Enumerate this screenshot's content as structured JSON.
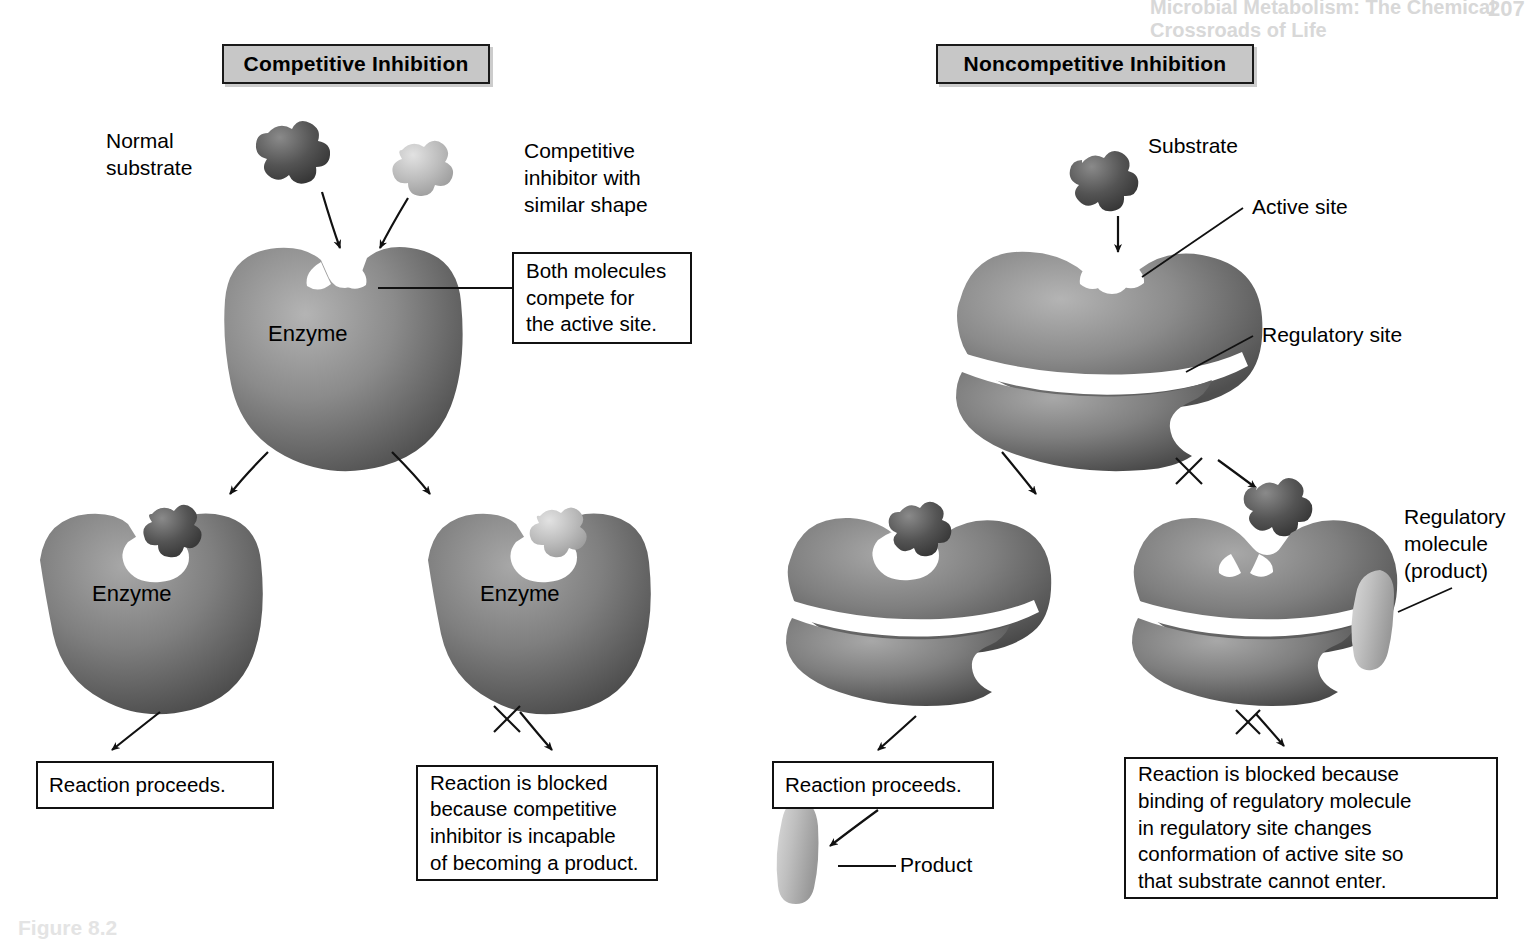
{
  "page": {
    "running_head": "Microbial Metabolism: The Chemical Crossroads of Life",
    "page_number": "207",
    "figure_caption": "Figure 8.2"
  },
  "panels": [
    {
      "id": "competitive",
      "title": "Competitive Inhibition",
      "labels": {
        "normal_substrate": "Normal\nsubstrate",
        "inhibitor": "Competitive\ninhibitor with\nsimilar shape",
        "enzyme_top": "Enzyme",
        "enzyme_left": "Enzyme",
        "enzyme_right": "Enzyme"
      },
      "callouts": {
        "compete": "Both molecules\ncompete for\nthe active site.",
        "proceeds": "Reaction proceeds.",
        "blocked": "Reaction is blocked\nbecause competitive\ninhibitor is incapable\nof becoming a product."
      }
    },
    {
      "id": "noncompetitive",
      "title": "Noncompetitive Inhibition",
      "labels": {
        "substrate": "Substrate",
        "active_site": "Active site",
        "regulatory_site": "Regulatory site",
        "regulatory_molecule": "Regulatory\nmolecule\n(product)",
        "product": "Product"
      },
      "callouts": {
        "proceeds": "Reaction proceeds.",
        "blocked": "Reaction is blocked because\nbinding of regulatory molecule\nin regulatory site changes\nconformation of active site so\nthat substrate cannot enter."
      }
    }
  ],
  "colors": {
    "plaque_fill": "#c7c7c7",
    "outline": "#111111",
    "enzyme_dark": "#5a5a5a",
    "enzyme_mid": "#8e8e8e",
    "enzyme_light": "#b9b9b9",
    "substrate_dark": "#4a4a4a",
    "inhibitor_light": "#bdbdbd",
    "product_light": "#c3c3c3",
    "page_bg": "#ffffff"
  }
}
